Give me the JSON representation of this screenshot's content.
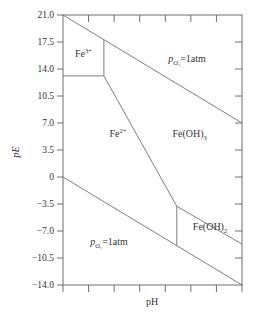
{
  "chart_data": {
    "type": "line",
    "title": "",
    "xlabel": "pH",
    "ylabel": "pE",
    "xlim": [
      0,
      14
    ],
    "ylim": [
      -14,
      21
    ],
    "x_ticks": [
      0,
      2,
      4,
      6,
      8,
      10,
      12,
      14
    ],
    "x_tick_labels": [],
    "y_ticks": [
      21.0,
      17.5,
      14.0,
      10.5,
      7.0,
      3.5,
      0,
      -3.5,
      -7.0,
      -10.5,
      -14.0
    ],
    "y_tick_labels": [
      "21.0",
      "17.5",
      "14.0",
      "10.5",
      "7.0",
      "3.5",
      "0",
      "-3.5",
      "-7.0",
      "-10.5",
      "-14.0"
    ],
    "grid": false,
    "series": [
      {
        "name": "O2/H2O boundary",
        "points": [
          [
            0,
            21
          ],
          [
            14,
            7
          ]
        ]
      },
      {
        "name": "H2O/H2 boundary",
        "points": [
          [
            0,
            0
          ],
          [
            14,
            -14
          ]
        ]
      },
      {
        "name": "Fe3+/Fe2+",
        "points": [
          [
            0,
            13.1
          ],
          [
            3.2,
            13.1
          ]
        ]
      },
      {
        "name": "Fe3+/Fe(OH)3",
        "points": [
          [
            3.2,
            13.1
          ],
          [
            3.2,
            17.8
          ]
        ]
      },
      {
        "name": "Fe2+/Fe(OH)3",
        "points": [
          [
            3.2,
            13.1
          ],
          [
            8.9,
            -3.8
          ]
        ]
      },
      {
        "name": "Fe2+/Fe(OH)2",
        "points": [
          [
            8.9,
            -3.8
          ],
          [
            8.9,
            -8.9
          ]
        ]
      },
      {
        "name": "Fe(OH)3/Fe(OH)2",
        "points": [
          [
            8.9,
            -3.8
          ],
          [
            14,
            -8.7
          ]
        ]
      }
    ],
    "region_labels": [
      {
        "name": "fe3",
        "base": "Fe",
        "sup": "3+",
        "sub": "",
        "tail": "",
        "x": 1.6,
        "y": 15.6
      },
      {
        "name": "fe2",
        "base": "Fe",
        "sup": "2+",
        "sub": "",
        "tail": "",
        "x": 4.3,
        "y": 5.2
      },
      {
        "name": "feoh3",
        "base": "Fe(OH)",
        "sup": "",
        "sub": "3",
        "tail": "",
        "x": 9.9,
        "y": 5.2
      },
      {
        "name": "feoh2",
        "base": "Fe(OH)",
        "sup": "",
        "sub": "2",
        "tail": "",
        "x": 11.5,
        "y": -6.9
      },
      {
        "name": "po2-upper",
        "base": "p",
        "sup": "",
        "sub": "O₂",
        "tail": "=1atm",
        "x": 9.7,
        "y": 14.9
      },
      {
        "name": "po2-lower",
        "base": "p",
        "sup": "",
        "sub": "O₂",
        "tail": "=1atm",
        "x": 3.6,
        "y": -8.8
      }
    ],
    "annotations": [
      "Fe3+",
      "Fe2+",
      "Fe(OH)3",
      "Fe(OH)2",
      "pO2=1atm",
      "pO2=1atm"
    ]
  }
}
